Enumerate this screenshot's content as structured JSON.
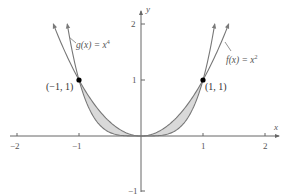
{
  "chart_data": {
    "type": "line",
    "title": "",
    "xlabel": "x",
    "ylabel": "y",
    "xlim": [
      -2,
      2
    ],
    "ylim": [
      -1,
      2
    ],
    "grid": false,
    "x_ticks": [
      "-2",
      "-1",
      "1",
      "2"
    ],
    "y_ticks": [
      "2",
      "1",
      "-1"
    ],
    "series": [
      {
        "name": "f(x) = x^2",
        "expression": "x^2",
        "domain": [
          -1.414,
          1.414
        ],
        "color": "#777777"
      },
      {
        "name": "g(x) = x^4",
        "expression": "x^4",
        "domain": [
          -1.189,
          1.189
        ],
        "color": "#777777"
      }
    ],
    "shaded_region": {
      "between": [
        "x^4",
        "x^2"
      ],
      "x_range": [
        -1,
        1
      ],
      "color": "#d9d9d9"
    },
    "points": [
      {
        "label": "(−1, 1)",
        "x": -1,
        "y": 1
      },
      {
        "label": "(1, 1)",
        "x": 1,
        "y": 1
      }
    ],
    "annotations": [
      {
        "text": "g(x) = x⁴",
        "attached_to": "g(x) = x^4"
      },
      {
        "text": "f(x) = x²",
        "attached_to": "f(x) = x^2"
      }
    ]
  },
  "labels": {
    "x_axis": "x",
    "y_axis": "y",
    "tick_x_neg2": "−2",
    "tick_x_neg1": "−1",
    "tick_x_1": "1",
    "tick_x_2": "2",
    "tick_y_2": "2",
    "tick_y_1": "1",
    "tick_y_neg1": "−1",
    "g_label_prefix": "g(x) = x",
    "g_label_exp": "4",
    "f_label_prefix": "f(x) = x",
    "f_label_exp": "2",
    "point_left": "(−1, 1)",
    "point_right": "(1, 1)"
  },
  "colors": {
    "axis": "#666666",
    "curve": "#7a7a7a",
    "fill": "#d9d9d9",
    "point": "#000000"
  }
}
